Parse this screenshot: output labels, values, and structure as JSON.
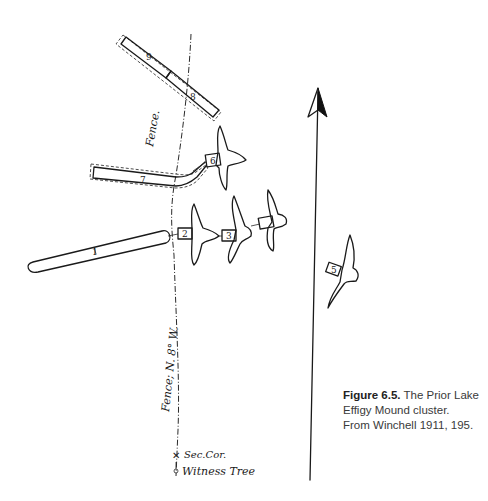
{
  "figure": {
    "caption_label": "Figure 6.5.",
    "caption_text_line1": "The Prior Lake",
    "caption_text_line2": "Effigy Mound cluster.",
    "caption_source": "From Winchell 1911, 195."
  },
  "map_labels": {
    "fence_top": "Fence.",
    "fence_bottom": "Fence; N. 8° W.",
    "sec_corner": "Sec.Cor.",
    "witness_tree": "Witness Tree"
  },
  "mounds": [
    {
      "id": "1",
      "type": "linear"
    },
    {
      "id": "2",
      "type": "bird effigy"
    },
    {
      "id": "3",
      "type": "bird effigy"
    },
    {
      "id": "4",
      "type": "bird effigy"
    },
    {
      "id": "5",
      "type": "bird effigy"
    },
    {
      "id": "6",
      "type": "bird effigy"
    },
    {
      "id": "7",
      "type": "linear"
    },
    {
      "id": "8",
      "type": "linear"
    },
    {
      "id": "9",
      "type": "linear"
    }
  ],
  "colors": {
    "ink": "#1a1a1a",
    "caption": "#3a3a3a",
    "background": "#ffffff"
  }
}
